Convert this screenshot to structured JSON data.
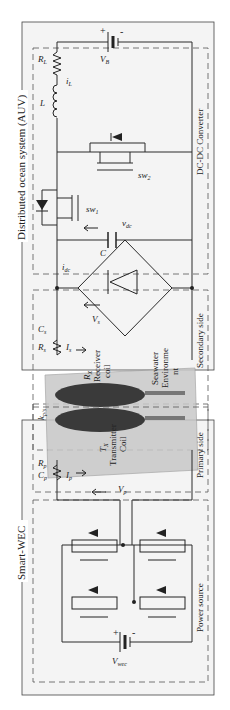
{
  "diagram": {
    "orientation": "rotated-90-ccw",
    "colors": {
      "background": "#ffffff",
      "panel_fill": "#f4f4f4",
      "wire": "#2a2a2a",
      "dashed_box": "#555555",
      "coil_dark": "#3a3a3a",
      "seawater_box": "#b8b8b8"
    },
    "systems": {
      "auv": {
        "title": "Distributed ocean system (AUV)"
      },
      "wec": {
        "title": "Smart-WEC"
      }
    },
    "sections": {
      "dcdc": "DC-DC Converter",
      "secondary": "Secondary side",
      "primary": "Primary side",
      "power": "Power source"
    },
    "components": {
      "battery_auv": {
        "label": "V",
        "sub": "B",
        "plus": "+",
        "minus": "-"
      },
      "rl": {
        "label": "R",
        "sub": "L"
      },
      "il": {
        "label": "i",
        "sub": "L"
      },
      "inductor": {
        "label": "L"
      },
      "sw1": {
        "label": "sw",
        "sub": "1"
      },
      "sw2": {
        "label": "sw",
        "sub": "2"
      },
      "cap_dc": {
        "label": "C"
      },
      "vdc": {
        "label": "v",
        "sub": "dc"
      },
      "idc": {
        "label": "i",
        "sub": "dc"
      },
      "vs": {
        "label": "V",
        "sub": "s"
      },
      "cs": {
        "label": "C",
        "sub": "s"
      },
      "rs": {
        "label": "R",
        "sub": "s"
      },
      "is": {
        "label": "I",
        "sub": "s"
      },
      "rx": {
        "label": "R",
        "sub": "X",
        "line2": "Receiver",
        "line3": "coil"
      },
      "seawater": {
        "line1": "Seawater",
        "line2": "Environme",
        "line3": "nt"
      },
      "k": {
        "label": "k",
        "sub": "p/s"
      },
      "tx": {
        "label": "T",
        "sub": "X",
        "line2": "Transmitter",
        "line3": "Coil"
      },
      "cp": {
        "label": "C",
        "sub": "p"
      },
      "rp": {
        "label": "R",
        "sub": "p"
      },
      "ip": {
        "label": "I",
        "sub": "p"
      },
      "vp": {
        "label": "V",
        "sub": "p"
      },
      "battery_wec": {
        "label": "V",
        "sub": "wec",
        "plus": "+",
        "minus": "-"
      }
    }
  }
}
